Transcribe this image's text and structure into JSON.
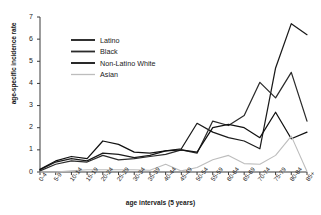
{
  "chart_data": {
    "type": "line",
    "title": "",
    "xlabel": "age intervals (5 years)",
    "ylabel": "age-specific incidence rate",
    "ylim": [
      0,
      7
    ],
    "yticks": [
      0,
      1,
      2,
      3,
      4,
      5,
      6,
      7
    ],
    "grid": false,
    "legend_position": "upper-left",
    "categories": [
      "0-4",
      "5-9",
      "10-14",
      "15-19",
      "20-24",
      "25-29",
      "30-34",
      "35-39",
      "40-44",
      "45-49",
      "50-54",
      "55-59",
      "60-64",
      "65-69",
      "70-74",
      "75-79",
      "80-84",
      "85+"
    ],
    "series": [
      {
        "name": "Latino",
        "color": "#1a1a1a",
        "values": [
          0.1,
          0.45,
          0.6,
          0.5,
          0.85,
          0.8,
          0.65,
          0.75,
          0.95,
          1.05,
          2.2,
          1.8,
          1.55,
          1.4,
          1.05,
          4.7,
          6.7,
          6.2
        ]
      },
      {
        "name": "Black",
        "color": "#2b2b2b",
        "values": [
          0.05,
          0.35,
          0.5,
          0.45,
          0.75,
          0.55,
          0.6,
          0.7,
          0.8,
          1.0,
          0.85,
          2.3,
          2.1,
          2.55,
          4.05,
          3.35,
          4.5,
          2.3
        ]
      },
      {
        "name": "Non-Latino White",
        "color": "#111111",
        "values": [
          0.12,
          0.5,
          0.7,
          0.6,
          1.4,
          1.25,
          0.9,
          0.85,
          0.95,
          1.0,
          0.9,
          2.0,
          2.15,
          2.0,
          1.55,
          2.7,
          1.5,
          1.8
        ]
      },
      {
        "name": "Asian",
        "color": "#bdbdbd",
        "values": [
          0.0,
          0.0,
          0.05,
          0.1,
          0.1,
          0.1,
          0.1,
          0.08,
          0.35,
          0.05,
          0.2,
          0.55,
          0.75,
          0.38,
          0.35,
          0.75,
          1.62,
          0.02
        ]
      }
    ]
  },
  "legend": {
    "items": [
      {
        "label": "Latino"
      },
      {
        "label": "Black"
      },
      {
        "label": "Non-Latino White"
      },
      {
        "label": "Asian"
      }
    ]
  }
}
